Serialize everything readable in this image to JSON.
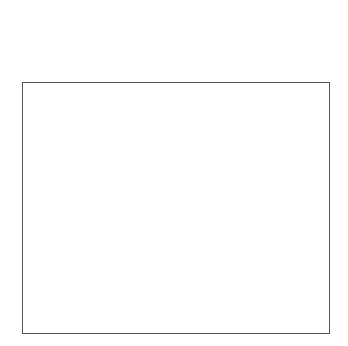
{
  "colors": {
    "K": "#121212",
    "D": "#717171",
    "M": "#9a9a9a",
    "L": "#bcbcbc",
    "W": "#e4e4e4",
    "band": "#ffffff",
    "outline": "#555555",
    "background": "#ffffff"
  },
  "strip_top": {
    "separate_squares": [
      {
        "x": 11,
        "o": "f",
        "a": "S",
        "b": "S"
      },
      {
        "x": 44,
        "o": "b",
        "a": "D",
        "b": "D"
      },
      {
        "x": 77,
        "o": "f",
        "a": "L",
        "b": "M"
      }
    ],
    "contiguous_x": 110,
    "contiguous": [
      {
        "o": "b",
        "a": "PK",
        "b": "PK"
      },
      {
        "o": "f",
        "a": "T",
        "b": "PC"
      },
      {
        "o": "b",
        "a": "M",
        "b": "L"
      },
      {
        "o": "f",
        "a": "M",
        "b": "L"
      },
      {
        "o": "b",
        "a": "PK",
        "b": "PK"
      },
      {
        "o": "f",
        "a": "S",
        "b": "S"
      },
      {
        "o": "b",
        "a": "L",
        "b": "M"
      },
      {
        "o": "f",
        "a": "L",
        "b": "L"
      },
      {
        "o": "b",
        "a": "M",
        "b": "M"
      }
    ]
  },
  "strip_second": [
    {
      "o": "b",
      "a": "D",
      "b": "M"
    },
    {
      "o": "f",
      "a": "PC",
      "b": "PC"
    },
    {
      "o": "b",
      "a": "L",
      "b": "L"
    },
    {
      "o": "f",
      "a": "S",
      "b": "S"
    },
    {
      "o": "b",
      "a": "D",
      "b": "D"
    },
    {
      "o": "f",
      "a": "SL",
      "b": "SL"
    },
    {
      "o": "b",
      "a": "M",
      "b": "D"
    },
    {
      "o": "f",
      "a": "W",
      "b": "T"
    },
    {
      "o": "b",
      "a": "D",
      "b": "M"
    },
    {
      "o": "f",
      "a": "T",
      "b": "T"
    },
    {
      "o": "b",
      "a": "K",
      "b": "K"
    },
    {
      "o": "f",
      "a": "W",
      "b": "W"
    }
  ],
  "grid": {
    "columns": 12,
    "rows": 10,
    "cells": [
      [
        [
          "L",
          "M"
        ],
        [
          "M",
          "L"
        ],
        [
          "T",
          "L"
        ],
        [
          "D",
          "M"
        ],
        [
          "PC",
          "PC"
        ],
        [
          "K",
          "L"
        ],
        [
          "SL",
          "L"
        ],
        [
          "PD",
          "M"
        ],
        [
          "SL",
          "L"
        ],
        [
          "D",
          "M"
        ],
        [
          "T",
          "L"
        ],
        [
          "D",
          "M"
        ]
      ],
      [
        [
          "K",
          "K"
        ],
        [
          "W",
          "T"
        ],
        [
          "K",
          "K"
        ],
        [
          "M",
          "L"
        ],
        [
          "D",
          "M"
        ],
        [
          "L",
          "M"
        ],
        [
          "K",
          "K"
        ],
        [
          "M",
          "L"
        ],
        [
          "L",
          "M"
        ],
        [
          "SL",
          "S"
        ],
        [
          "L",
          "M"
        ],
        [
          "D",
          "M"
        ]
      ],
      [
        [
          "PC",
          "PC"
        ],
        [
          "PD",
          "M"
        ],
        [
          "S",
          "S"
        ],
        [
          "M",
          "L"
        ],
        [
          "W",
          "T"
        ],
        [
          "D",
          "M"
        ],
        [
          "PC",
          "PC"
        ],
        [
          "M",
          "L"
        ],
        [
          "PK",
          "PK"
        ],
        [
          "L",
          "M"
        ],
        [
          "K",
          "K"
        ],
        [
          "M",
          "L"
        ]
      ],
      [
        [
          "PK",
          "PK"
        ],
        [
          "W",
          "T"
        ],
        [
          "K",
          "K"
        ],
        [
          "S",
          "SL"
        ],
        [
          "PK",
          "PK"
        ],
        [
          "M",
          "L"
        ],
        [
          "S",
          "PC"
        ],
        [
          "PC",
          "PC"
        ],
        [
          "M",
          "L"
        ],
        [
          "PC",
          "PC"
        ],
        [
          "M",
          "L"
        ],
        [
          "L",
          "M"
        ]
      ],
      [
        [
          "T",
          "PC"
        ],
        [
          "S",
          "L"
        ],
        [
          "M",
          "L"
        ],
        [
          "D",
          "M"
        ],
        [
          "L",
          "S"
        ],
        [
          "D",
          "M"
        ],
        [
          "W",
          "L"
        ],
        [
          "M",
          "L"
        ],
        [
          "W",
          "T"
        ],
        [
          "D",
          "M"
        ],
        [
          "SL",
          "L"
        ],
        [
          "PD",
          "M"
        ]
      ],
      [
        [
          "M",
          "L"
        ],
        [
          "L",
          "M"
        ],
        [
          "PD",
          "M"
        ],
        [
          "L",
          "M"
        ],
        [
          "S",
          "L"
        ],
        [
          "M",
          "L"
        ],
        [
          "K",
          "K"
        ],
        [
          "M",
          "L"
        ],
        [
          "D",
          "M"
        ],
        [
          "S",
          "L"
        ],
        [
          "K",
          "K"
        ],
        [
          "W",
          "T"
        ]
      ],
      [
        [
          "PC",
          "PC"
        ],
        [
          "K",
          "K"
        ],
        [
          "M",
          "L"
        ],
        [
          "PC",
          "PC"
        ],
        [
          "L",
          "M"
        ],
        [
          "D",
          "M"
        ],
        [
          "W",
          "T"
        ],
        [
          "D",
          "M"
        ],
        [
          "PC",
          "PC"
        ],
        [
          "T",
          "W"
        ],
        [
          "D",
          "M"
        ],
        [
          "PC",
          "PC"
        ]
      ],
      [
        [
          "M",
          "L"
        ],
        [
          "L",
          "M"
        ],
        [
          "S",
          "L"
        ],
        [
          "W",
          "T"
        ],
        [
          "PK",
          "PK"
        ],
        [
          "PC",
          "PC"
        ],
        [
          "M",
          "L"
        ],
        [
          "S",
          "SL"
        ],
        [
          "M",
          "S"
        ],
        [
          "PD",
          "M"
        ],
        [
          "D",
          "M"
        ],
        [
          "S",
          "L"
        ]
      ],
      [
        [
          "PK",
          "PK"
        ],
        [
          "D",
          "M"
        ],
        [
          "T",
          "PC"
        ],
        [
          "M",
          "L"
        ],
        [
          "W",
          "L"
        ],
        [
          "PD",
          "M"
        ],
        [
          "W",
          "T"
        ],
        [
          "K",
          "K"
        ],
        [
          "S",
          "SL"
        ],
        [
          "K",
          "K"
        ],
        [
          "SL",
          "L"
        ],
        [
          "PK",
          "PK"
        ]
      ],
      [
        [
          "PC",
          "PC"
        ],
        [
          "W",
          "SL"
        ],
        [
          "K",
          "K"
        ],
        [
          "L",
          "M"
        ],
        [
          "S",
          "M"
        ],
        [
          "M",
          "L"
        ],
        [
          "K",
          "K"
        ],
        [
          "L",
          "M"
        ],
        [
          "T",
          "PC"
        ],
        [
          "D",
          "M"
        ],
        [
          "D",
          "M"
        ],
        [
          "S",
          "SL"
        ]
      ]
    ]
  }
}
